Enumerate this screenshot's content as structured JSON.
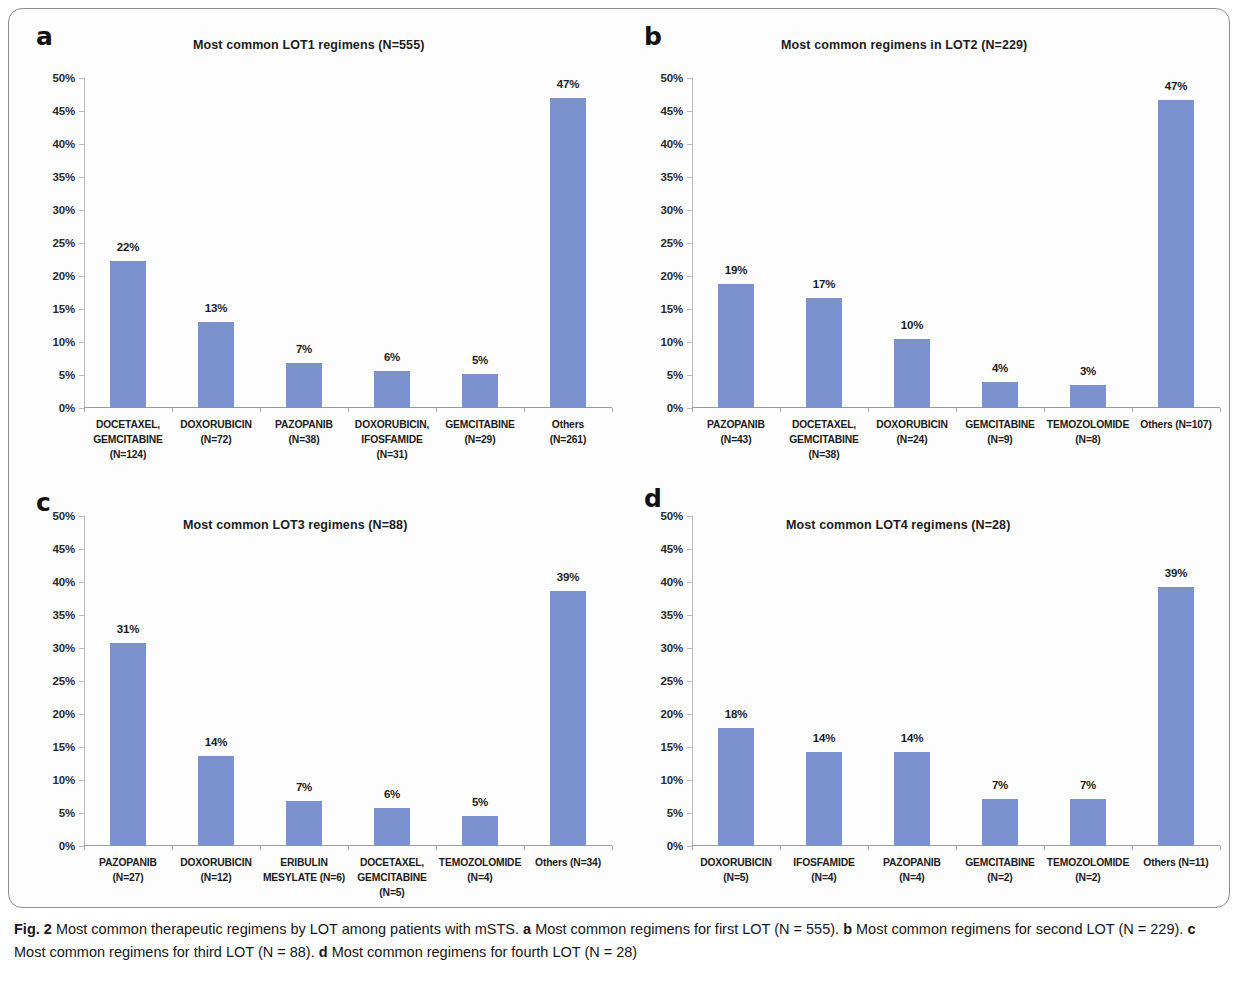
{
  "figure": {
    "caption_label": "Fig. 2",
    "caption_text": "Most common therapeutic regimens by LOT among patients with mSTS.",
    "caption_parts": [
      {
        "letter": "a",
        "text": "Most common regimens for first LOT (N = 555)."
      },
      {
        "letter": "b",
        "text": "Most common regimens for second LOT (N = 229)."
      },
      {
        "letter": "c",
        "text": "Most common regimens for third  LOT (N = 88)."
      },
      {
        "letter": "d",
        "text": "Most common regimens for fourth LOT (N = 28)"
      }
    ],
    "bar_color": "#7b92ce",
    "axis_color": "#b9b9b9"
  },
  "panels": [
    {
      "letter": "a",
      "title": "Most common LOT1 regimens (N=555)"
    },
    {
      "letter": "b",
      "title": "Most common regimens in LOT2 (N=229)"
    },
    {
      "letter": "c",
      "title": "Most common LOT3 regimens (N=88)"
    },
    {
      "letter": "d",
      "title": "Most common LOT4 regimens (N=28)"
    }
  ],
  "chart_data": [
    {
      "panel": "a",
      "type": "bar",
      "title": "Most common LOT1 regimens (N=555)",
      "xlabel": "",
      "ylabel": "",
      "ylim": [
        0,
        50
      ],
      "ytick_labels": [
        "0%",
        "5%",
        "10%",
        "15%",
        "20%",
        "25%",
        "30%",
        "35%",
        "40%",
        "45%",
        "50%"
      ],
      "ytick_values": [
        0,
        5,
        10,
        15,
        20,
        25,
        30,
        35,
        40,
        45,
        50
      ],
      "grid": false,
      "legend": "none",
      "categories": [
        [
          "DOCETAXEL,",
          "GEMCITABINE",
          "(N=124)"
        ],
        [
          "DOXORUBICIN",
          "(N=72)"
        ],
        [
          "PAZOPANIB",
          "(N=38)"
        ],
        [
          "DOXORUBICIN,",
          "IFOSFAMIDE",
          "(N=31)"
        ],
        [
          "GEMCITABINE",
          "(N=29)"
        ],
        [
          "Others",
          "(N=261)"
        ]
      ],
      "values": [
        22.3,
        13.0,
        6.8,
        5.6,
        5.2,
        47.0
      ],
      "data_labels": [
        "22%",
        "13%",
        "7%",
        "6%",
        "5%",
        "47%"
      ]
    },
    {
      "panel": "b",
      "type": "bar",
      "title": "Most common regimens in LOT2 (N=229)",
      "xlabel": "",
      "ylabel": "",
      "ylim": [
        0,
        50
      ],
      "ytick_labels": [
        "0%",
        "5%",
        "10%",
        "15%",
        "20%",
        "25%",
        "30%",
        "35%",
        "40%",
        "45%",
        "50%"
      ],
      "ytick_values": [
        0,
        5,
        10,
        15,
        20,
        25,
        30,
        35,
        40,
        45,
        50
      ],
      "grid": false,
      "legend": "none",
      "categories": [
        [
          "PAZOPANIB",
          "(N=43)"
        ],
        [
          "DOCETAXEL,",
          "GEMCITABINE",
          "(N=38)"
        ],
        [
          "DOXORUBICIN",
          "(N=24)"
        ],
        [
          "GEMCITABINE",
          "(N=9)"
        ],
        [
          "TEMOZOLOMIDE",
          "(N=8)"
        ],
        [
          "Others (N=107)"
        ]
      ],
      "values": [
        18.8,
        16.6,
        10.5,
        3.9,
        3.5,
        46.7
      ],
      "data_labels": [
        "19%",
        "17%",
        "10%",
        "4%",
        "3%",
        "47%"
      ]
    },
    {
      "panel": "c",
      "type": "bar",
      "title": "Most common LOT3 regimens (N=88)",
      "xlabel": "",
      "ylabel": "",
      "ylim": [
        0,
        50
      ],
      "ytick_labels": [
        "0%",
        "5%",
        "10%",
        "15%",
        "20%",
        "25%",
        "30%",
        "35%",
        "40%",
        "45%",
        "50%"
      ],
      "ytick_values": [
        0,
        5,
        10,
        15,
        20,
        25,
        30,
        35,
        40,
        45,
        50
      ],
      "grid": false,
      "legend": "none",
      "categories": [
        [
          "PAZOPANIB",
          "(N=27)"
        ],
        [
          "DOXORUBICIN",
          "(N=12)"
        ],
        [
          "ERIBULIN",
          "MESYLATE (N=6)"
        ],
        [
          "DOCETAXEL,",
          "GEMCITABINE",
          "(N=5)"
        ],
        [
          "TEMOZOLOMIDE",
          "(N=4)"
        ],
        [
          "Others (N=34)"
        ]
      ],
      "values": [
        30.7,
        13.6,
        6.8,
        5.7,
        4.5,
        38.6
      ],
      "data_labels": [
        "31%",
        "14%",
        "7%",
        "6%",
        "5%",
        "39%"
      ]
    },
    {
      "panel": "d",
      "type": "bar",
      "title": "Most common LOT4 regimens (N=28)",
      "xlabel": "",
      "ylabel": "",
      "ylim": [
        0,
        50
      ],
      "ytick_labels": [
        "0%",
        "5%",
        "10%",
        "15%",
        "20%",
        "25%",
        "30%",
        "35%",
        "40%",
        "45%",
        "50%"
      ],
      "ytick_values": [
        0,
        5,
        10,
        15,
        20,
        25,
        30,
        35,
        40,
        45,
        50
      ],
      "grid": false,
      "legend": "none",
      "categories": [
        [
          "DOXORUBICIN",
          "(N=5)"
        ],
        [
          "IFOSFAMIDE",
          "(N=4)"
        ],
        [
          "PAZOPANIB",
          "(N=4)"
        ],
        [
          "GEMCITABINE",
          "(N=2)"
        ],
        [
          "TEMOZOLOMIDE",
          "(N=2)"
        ],
        [
          "Others (N=11)"
        ]
      ],
      "values": [
        17.9,
        14.3,
        14.3,
        7.1,
        7.1,
        39.3
      ],
      "data_labels": [
        "18%",
        "14%",
        "14%",
        "7%",
        "7%",
        "39%"
      ]
    }
  ]
}
